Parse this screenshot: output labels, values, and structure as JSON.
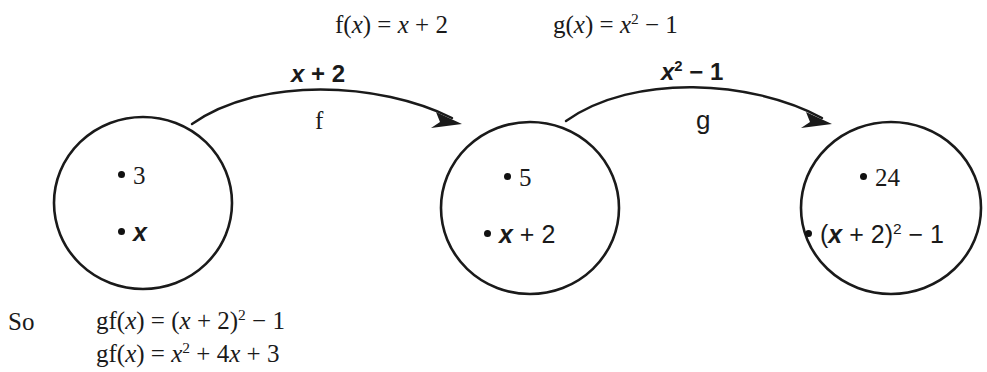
{
  "header": {
    "f_definition": "f(x) = x + 2",
    "g_definition": "g(x) = x² − 1"
  },
  "arrows": [
    {
      "name": "f",
      "top_label": "x + 2",
      "bottom_label": "f",
      "from": "set-1",
      "to": "set-2"
    },
    {
      "name": "g",
      "top_label": "x² − 1",
      "bottom_label": "g",
      "from": "set-2",
      "to": "set-3"
    }
  ],
  "sets": [
    {
      "id": "set-1",
      "elements": [
        "3",
        "x"
      ]
    },
    {
      "id": "set-2",
      "elements": [
        "5",
        "x + 2"
      ]
    },
    {
      "id": "set-3",
      "elements": [
        "24",
        "(x + 2)² − 1"
      ]
    }
  ],
  "conclusion": {
    "lead_in": "So",
    "lines": [
      "gf(x) = (x + 2)² − 1",
      "gf(x) = x² + 4x + 3"
    ]
  }
}
